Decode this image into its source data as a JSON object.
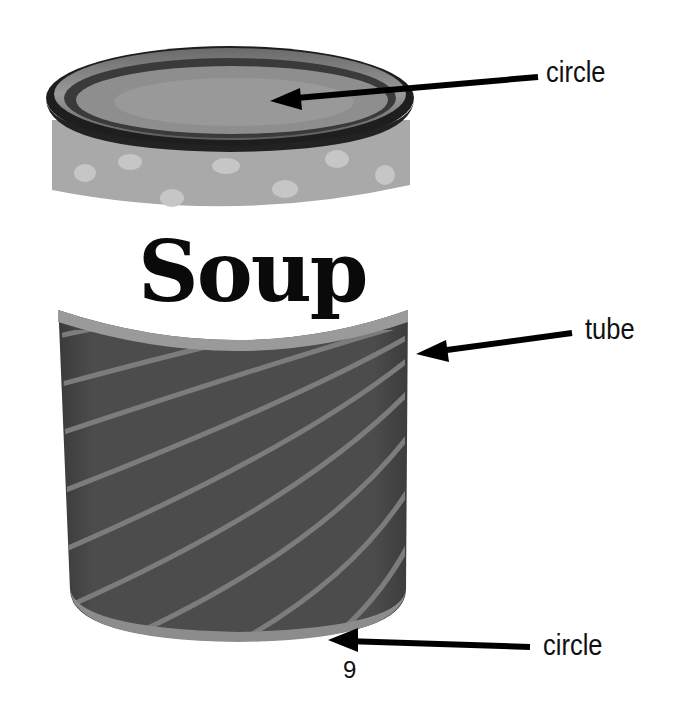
{
  "diagram": {
    "can_label_text": "Soup",
    "colors": {
      "lid_dark": "#1a1a1a",
      "lid_mid": "#8a8a8a",
      "top_band": "#a8a8a8",
      "dots": "#c8c8c8",
      "label_white": "#ffffff",
      "body": "#4a4a4a",
      "stripes": "#7a7a7a",
      "arrow": "#000000"
    },
    "annotations": [
      {
        "id": "top-lid",
        "text": "circle"
      },
      {
        "id": "side",
        "text": "tube"
      },
      {
        "id": "bottom",
        "text": "circle"
      }
    ],
    "page_number": "9"
  }
}
